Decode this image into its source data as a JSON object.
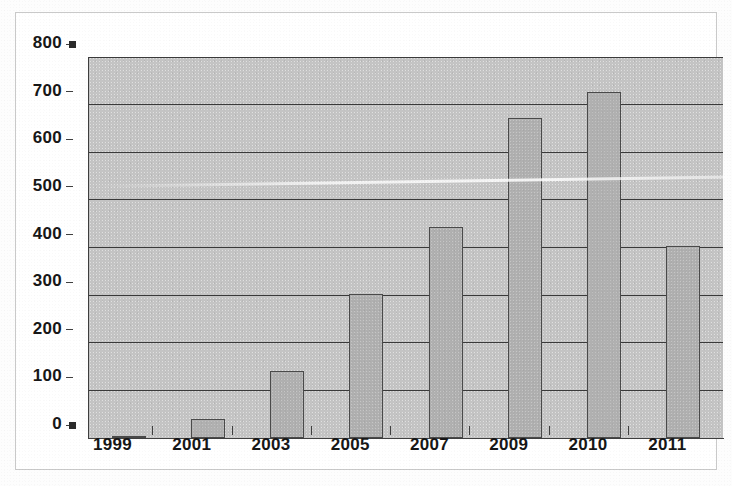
{
  "figure": {
    "background_color": "#ffffff",
    "plot_background_color": "#c4c4c4",
    "bar_fill_color": "#b0b0b0",
    "bar_outline_color": "#4a4a4a",
    "gridline_color": "#3a3a3a",
    "axis_color": "#3f3f3f",
    "text_color": "#171717"
  },
  "chart_data": {
    "type": "bar",
    "title": "",
    "subtitle": "",
    "xlabel": "",
    "ylabel": "",
    "categories": [
      "1999",
      "2001",
      "2003",
      "2005",
      "2007",
      "2009",
      "2010",
      "2011"
    ],
    "values": [
      2,
      40,
      140,
      302,
      443,
      672,
      727,
      404
    ],
    "ylim": [
      0,
      800
    ],
    "ytick_labels": [
      "0",
      "100",
      "200",
      "300",
      "400",
      "500",
      "600",
      "700",
      "800"
    ],
    "ytick_values": [
      0,
      100,
      200,
      300,
      400,
      500,
      600,
      700,
      800
    ],
    "ytick_interval": 100,
    "grid": "horizontal",
    "legend": "none",
    "annotations": []
  }
}
